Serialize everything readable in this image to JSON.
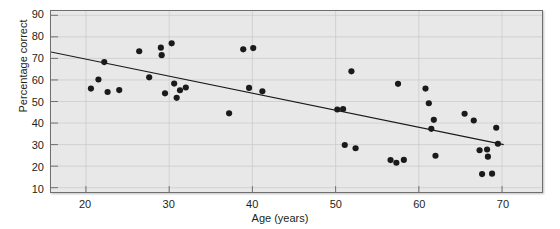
{
  "chart_data": {
    "type": "scatter",
    "title": "",
    "xlabel": "Age (years)",
    "ylabel": "Percentage correct",
    "xlim": [
      15.8,
      74.8
    ],
    "ylim": [
      8.0,
      92.0
    ],
    "xticks": [
      20,
      30,
      40,
      50,
      60,
      70
    ],
    "yticks": [
      10,
      20,
      30,
      40,
      50,
      60,
      70,
      80,
      90
    ],
    "grid": true,
    "legend": "none",
    "point_color": "#1a1a1a",
    "point_size": 3.1,
    "plot_background": "#e8e8e8",
    "grid_color": "#c8c8c8",
    "frame_color": "#6f6f6f",
    "series": [
      {
        "name": "Participants",
        "points": [
          [
            20.6,
            56.0
          ],
          [
            21.5,
            60.2
          ],
          [
            22.2,
            68.3
          ],
          [
            22.6,
            54.4
          ],
          [
            24.0,
            55.3
          ],
          [
            26.4,
            73.3
          ],
          [
            27.6,
            61.2
          ],
          [
            29.0,
            75.0
          ],
          [
            29.1,
            71.5
          ],
          [
            29.5,
            53.8
          ],
          [
            30.3,
            77.0
          ],
          [
            30.6,
            58.3
          ],
          [
            30.9,
            51.7
          ],
          [
            31.3,
            55.2
          ],
          [
            32.0,
            56.5
          ],
          [
            37.2,
            44.5
          ],
          [
            38.9,
            74.2
          ],
          [
            40.1,
            74.8
          ],
          [
            39.6,
            56.3
          ],
          [
            41.2,
            54.7
          ],
          [
            50.2,
            46.3
          ],
          [
            50.9,
            46.5
          ],
          [
            51.1,
            29.8
          ],
          [
            51.9,
            64.0
          ],
          [
            52.4,
            28.3
          ],
          [
            56.6,
            22.8
          ],
          [
            57.3,
            21.6
          ],
          [
            57.5,
            58.2
          ],
          [
            58.2,
            22.9
          ],
          [
            60.8,
            56.0
          ],
          [
            61.2,
            49.2
          ],
          [
            61.5,
            37.3
          ],
          [
            61.8,
            41.5
          ],
          [
            62.0,
            24.8
          ],
          [
            65.5,
            44.3
          ],
          [
            66.6,
            41.2
          ],
          [
            67.3,
            27.4
          ],
          [
            67.6,
            16.3
          ],
          [
            68.2,
            27.7
          ],
          [
            68.3,
            24.4
          ],
          [
            68.8,
            16.5
          ],
          [
            69.3,
            37.8
          ],
          [
            69.5,
            30.4
          ]
        ]
      }
    ],
    "trendline": {
      "name": "regression-line",
      "color": "#1a1a1a",
      "x_start": 15.8,
      "y_start": 73.0,
      "x_end": 70.2,
      "y_end": 30.0
    }
  },
  "axes": {
    "y_title": "Percentage correct",
    "x_title": "Age (years)",
    "y_tick_labels": [
      "90",
      "80",
      "70",
      "60",
      "50",
      "40",
      "30",
      "20",
      "10"
    ],
    "x_tick_labels": [
      "20",
      "30",
      "40",
      "50",
      "60",
      "70"
    ]
  }
}
